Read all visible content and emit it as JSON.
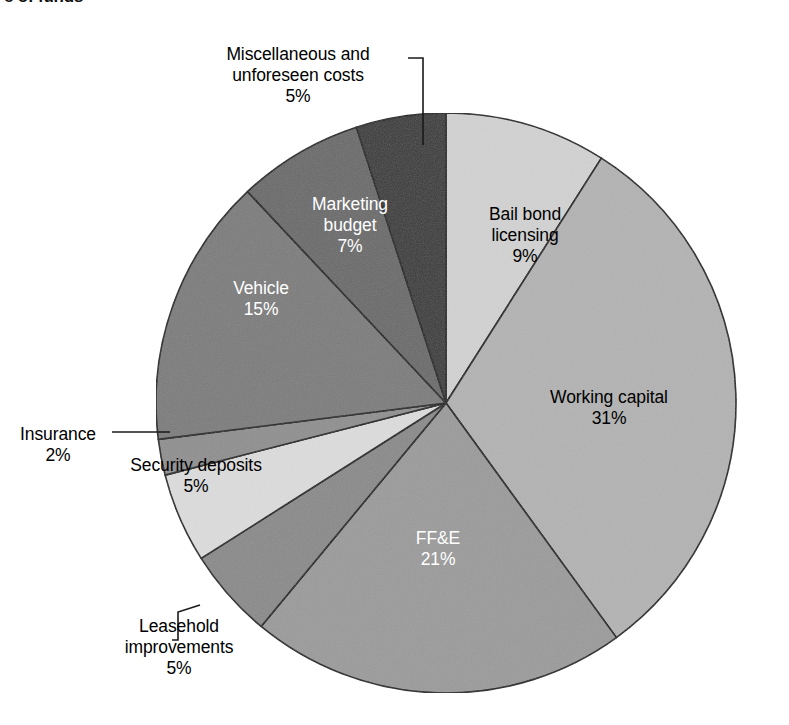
{
  "title": "e of funds",
  "chart_data": {
    "type": "pie",
    "title": "e of funds",
    "xlabel": "",
    "ylabel": "",
    "legend": "none (direct labels with leader lines)",
    "grid": false,
    "start_angle_deg": 0,
    "direction": "clockwise",
    "units": "percent",
    "categories": [
      "Bail bond licensing",
      "Working capital",
      "FF&E",
      "Leasehold improvements",
      "Security deposits",
      "Insurance",
      "Vehicle",
      "Marketing budget",
      "Miscellaneous and unforeseen costs"
    ],
    "values": [
      9,
      31,
      21,
      5,
      5,
      2,
      15,
      7,
      5
    ],
    "slices": [
      {
        "label": "Bail bond licensing",
        "value": 9,
        "pct_text": "9%",
        "color": "#d2d2d2",
        "text_color": "#000000",
        "inside": true
      },
      {
        "label": "Working capital",
        "value": 31,
        "pct_text": "31%",
        "color": "#b3b3b3",
        "text_color": "#000000",
        "inside": true
      },
      {
        "label": "FF&E",
        "value": 21,
        "pct_text": "21%",
        "color": "#9b9b9b",
        "text_color": "#ffffff",
        "inside": true
      },
      {
        "label": "Leasehold improvements",
        "value": 5,
        "pct_text": "5%",
        "color": "#8a8a8a",
        "text_color": "#000000",
        "inside": false
      },
      {
        "label": "Security deposits",
        "value": 5,
        "pct_text": "5%",
        "color": "#dcdcdc",
        "text_color": "#000000",
        "inside": true
      },
      {
        "label": "Insurance",
        "value": 2,
        "pct_text": "2%",
        "color": "#8f8f8f",
        "text_color": "#000000",
        "inside": false
      },
      {
        "label": "Vehicle",
        "value": 15,
        "pct_text": "15%",
        "color": "#7c7c7c",
        "text_color": "#ffffff",
        "inside": true
      },
      {
        "label": "Marketing budget",
        "value": 7,
        "pct_text": "7%",
        "color": "#6a6a6a",
        "text_color": "#ffffff",
        "inside": true
      },
      {
        "label": "Miscellaneous and unforeseen costs",
        "value": 5,
        "pct_text": "5%",
        "color": "#393939",
        "text_color": "#000000",
        "inside": false
      }
    ]
  },
  "labels": {
    "misc": {
      "line1": "Miscellaneous and",
      "line2": "unforeseen costs",
      "pct": "5%"
    },
    "marketing": {
      "line1": "Marketing",
      "line2": "budget",
      "pct": "7%"
    },
    "vehicle": {
      "line1": "Vehicle",
      "pct": "15%"
    },
    "bailbond": {
      "line1": "Bail bond",
      "line2": "licensing",
      "pct": "9%"
    },
    "working": {
      "line1": "Working capital",
      "pct": "31%"
    },
    "ffe": {
      "line1": "FF&E",
      "pct": "21%"
    },
    "security": {
      "line1": "Security deposits",
      "pct": "5%"
    },
    "insurance": {
      "line1": "Insurance",
      "pct": "2%"
    },
    "leasehold": {
      "line1": "Leasehold",
      "line2": "improvements",
      "pct": "5%"
    }
  },
  "style": {
    "background": "#ffffff",
    "outline": "#1a1a1a",
    "center_x": 446,
    "center_y": 403,
    "radius": 290
  }
}
